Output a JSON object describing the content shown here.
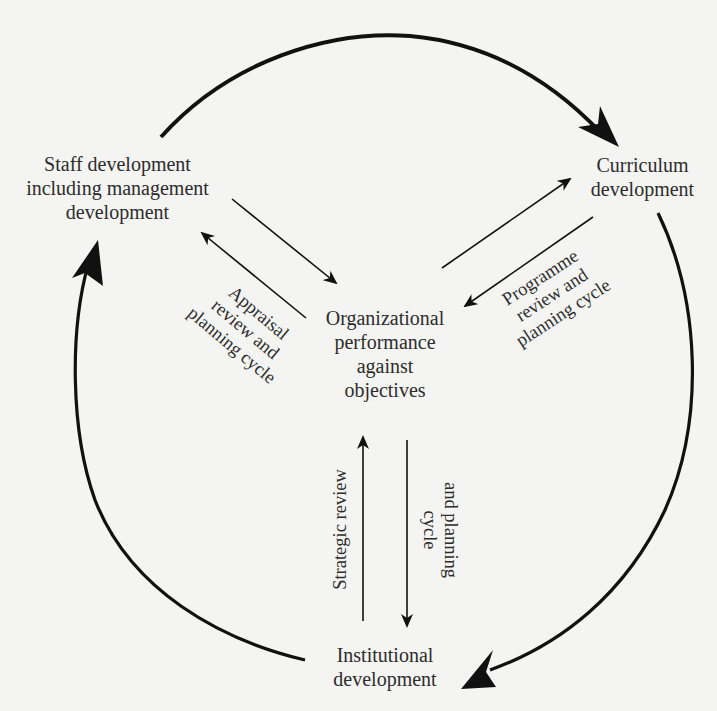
{
  "diagram": {
    "type": "cycle-diagram",
    "colors": {
      "background": "#f4f4f2",
      "stroke": "#111111",
      "text": "#2c2c2c"
    },
    "nodes": {
      "staff": {
        "lines": [
          "Staff development",
          "including management",
          "development"
        ]
      },
      "curriculum": {
        "lines": [
          "Curriculum",
          "development"
        ]
      },
      "center": {
        "lines": [
          "Organizational",
          "performance",
          "against",
          "objectives"
        ]
      },
      "institutional": {
        "lines": [
          "Institutional",
          "development"
        ]
      }
    },
    "cycle_labels": {
      "appraisal": {
        "lines": [
          "Appraisal",
          "review and",
          "planning cycle"
        ]
      },
      "programme": {
        "lines": [
          "Programme",
          "review and",
          "planning cycle"
        ]
      },
      "strategic_left": {
        "lines": [
          "Strategic review"
        ]
      },
      "strategic_right": {
        "lines": [
          "and planning",
          "cycle"
        ]
      }
    },
    "outer_cycle": [
      {
        "from": "Staff development including management development",
        "to": "Curriculum development"
      },
      {
        "from": "Curriculum development",
        "to": "Institutional development"
      },
      {
        "from": "Institutional development",
        "to": "Staff development including management development"
      }
    ],
    "inner_links": [
      {
        "from": "Staff development including management development",
        "to": "Organizational performance against objectives"
      },
      {
        "from": "Organizational performance against objectives",
        "to": "Staff development including management development",
        "label": "Appraisal review and planning cycle"
      },
      {
        "from": "Organizational performance against objectives",
        "to": "Curriculum development"
      },
      {
        "from": "Curriculum development",
        "to": "Organizational performance against objectives",
        "label": "Programme review and planning cycle"
      },
      {
        "from": "Institutional development",
        "to": "Organizational performance against objectives",
        "label": "Strategic review"
      },
      {
        "from": "Organizational performance against objectives",
        "to": "Institutional development",
        "label": "and planning cycle"
      }
    ]
  }
}
